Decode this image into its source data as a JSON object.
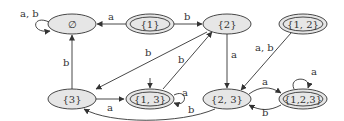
{
  "diagram": {
    "type": "finite-automaton (subset construction)",
    "nodes": [
      {
        "id": "empty",
        "label": "∅",
        "accepting": false,
        "start": false
      },
      {
        "id": "s1",
        "label": "{1}",
        "accepting": true,
        "start": false
      },
      {
        "id": "s2",
        "label": "{2}",
        "accepting": false,
        "start": false
      },
      {
        "id": "s12",
        "label": "{1, 2}",
        "accepting": true,
        "start": false
      },
      {
        "id": "s3",
        "label": "{3}",
        "accepting": false,
        "start": false
      },
      {
        "id": "s13",
        "label": "{1, 3}",
        "accepting": true,
        "start": true
      },
      {
        "id": "s23",
        "label": "{2, 3}",
        "accepting": false,
        "start": false
      },
      {
        "id": "s123",
        "label": "{1,2,3}",
        "accepting": true,
        "start": false
      }
    ],
    "edges": [
      {
        "from": "empty",
        "to": "empty",
        "label": "a, b"
      },
      {
        "from": "s1",
        "to": "empty",
        "label": "a"
      },
      {
        "from": "s1",
        "to": "s2",
        "label": "b"
      },
      {
        "from": "s2",
        "to": "s3",
        "label": "b"
      },
      {
        "from": "s2",
        "to": "s23",
        "label": "a"
      },
      {
        "from": "s3",
        "to": "empty",
        "label": "b"
      },
      {
        "from": "s3",
        "to": "s13",
        "label": "a"
      },
      {
        "from": "s13",
        "to": "s13",
        "label": "a"
      },
      {
        "from": "s13",
        "to": "s2",
        "label": "b"
      },
      {
        "from": "s12",
        "to": "s23",
        "label": "a, b"
      },
      {
        "from": "s23",
        "to": "s123",
        "label": "a"
      },
      {
        "from": "s23",
        "to": "s3",
        "label": "b"
      },
      {
        "from": "s123",
        "to": "s123",
        "label": "a"
      },
      {
        "from": "s123",
        "to": "s23",
        "label": "b"
      }
    ]
  }
}
